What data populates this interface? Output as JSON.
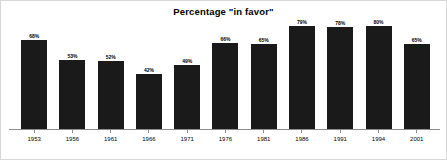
{
  "chart_data": {
    "type": "bar",
    "title": "Percentage \"in favor\"",
    "xlabel": "",
    "ylabel": "",
    "ylim": [
      0,
      100
    ],
    "grid": false,
    "legend": null,
    "categories": [
      "1953",
      "1956",
      "1961",
      "1966",
      "1971",
      "1976",
      "1981",
      "1986",
      "1991",
      "1994",
      "2001"
    ],
    "values": [
      68,
      53,
      52,
      42,
      49,
      66,
      65,
      79,
      78,
      80,
      65
    ],
    "data_labels": [
      "68%",
      "53%",
      "52%",
      "42%",
      "49%",
      "66%",
      "65%",
      "79%",
      "78%",
      "80%",
      "65%"
    ],
    "bar_color": "#1a1a1a",
    "background_color": "#ffffff",
    "axis_color": "#8d8d8d",
    "frame_color": "#d8d8d8"
  }
}
